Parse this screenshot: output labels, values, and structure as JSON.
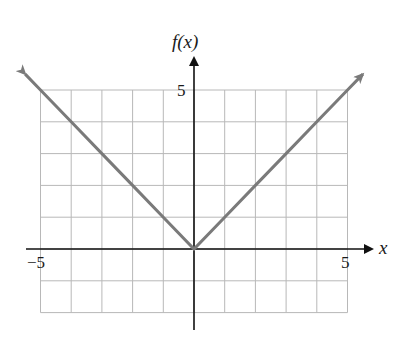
{
  "chart_data": {
    "type": "line",
    "title": "",
    "function": "f(x) = |x|",
    "xlabel": "x",
    "ylabel": "f(x)",
    "xlim": [
      -5,
      5
    ],
    "ylim": [
      -2,
      5
    ],
    "x_tick_labels": [
      "-5",
      "5"
    ],
    "y_tick_labels": [
      "5"
    ],
    "grid": true,
    "grid_step": 1,
    "series": [
      {
        "name": "f(x)",
        "x": [
          -5.5,
          -5,
          -4,
          -3,
          -2,
          -1,
          0,
          1,
          2,
          3,
          4,
          5,
          5.5
        ],
        "values": [
          5.5,
          5,
          4,
          3,
          2,
          1,
          0,
          1,
          2,
          3,
          4,
          5,
          5.5
        ],
        "arrows_at_ends": true,
        "color": "#7a7a7a"
      }
    ],
    "axis_color": "#111111",
    "grid_color": "#b8b8b8"
  },
  "labels": {
    "y_axis": "f(x)",
    "x_axis": "x",
    "y_tick_5": "5",
    "x_tick_neg5": "−5",
    "x_tick_5": "5"
  }
}
